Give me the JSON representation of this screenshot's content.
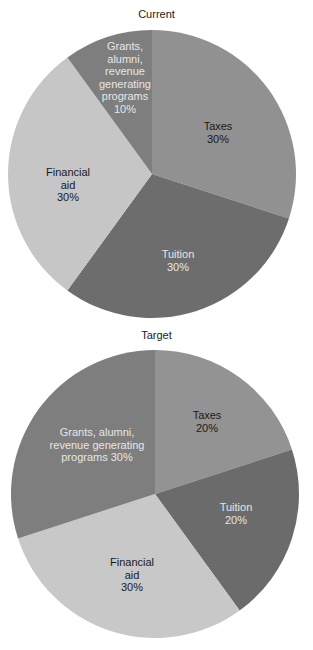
{
  "chart_data": [
    {
      "type": "pie",
      "title": "Current",
      "categories": [
        "Taxes",
        "Tuition",
        "Financial aid",
        "Grants, alumni, revenue generating programs"
      ],
      "values": [
        30,
        30,
        30,
        10
      ],
      "unit": "%",
      "start_angle": "12 o'clock",
      "direction": "clockwise",
      "colors": [
        "#919191",
        "#6d6d6d",
        "#c6c6c6",
        "#7e7e7e"
      ],
      "labels": [
        {
          "text": "Taxes\n30%",
          "color": "#1a1a1a"
        },
        {
          "text": "Tuition\n30%",
          "color": "#e6e6e6"
        },
        {
          "text": "Financial\naid\n30%",
          "color": "#1a1a1a"
        },
        {
          "text": "Grants,\nalumni,\nrevenue\ngenerating\nprograms\n10%",
          "color": "#e6e6e6"
        }
      ],
      "legend": "none"
    },
    {
      "type": "pie",
      "title": "Target",
      "categories": [
        "Taxes",
        "Tuition",
        "Financial aid",
        "Grants, alumni, revenue generating programs"
      ],
      "values": [
        20,
        20,
        30,
        30
      ],
      "unit": "%",
      "start_angle": "12 o'clock",
      "direction": "clockwise",
      "colors": [
        "#939393",
        "#6b6b6b",
        "#c8c8c8",
        "#7e7e7e"
      ],
      "labels": [
        {
          "text": "Taxes\n20%",
          "color": "#1a1a1a"
        },
        {
          "text": "Tuition\n20%",
          "color": "#e6e6e6"
        },
        {
          "text": "Financial\naid\n30%",
          "color": "#1a1a1a"
        },
        {
          "text": "Grants, alumni,\nrevenue generating\nprograms 30%",
          "color": "#e6e6e6"
        }
      ],
      "legend": "none"
    }
  ]
}
